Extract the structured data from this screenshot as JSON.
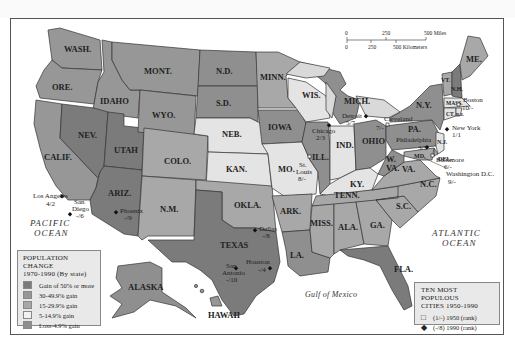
{
  "map": {
    "title": "POPULATION CHANGE",
    "subtitle": "1970-1990 (By state)",
    "colors": {
      "gain_50_plus": "#7b7b7b",
      "gain_30_49": "#979797",
      "gain_15_29": "#a8a8a8",
      "gain_5_14": "#e4e4e4",
      "loss_4_gain": "#8f8f8f",
      "water": "#ffffff",
      "great_lakes": "#d9d9d9"
    },
    "legend_population": {
      "title": "POPULATION CHANGE",
      "subtitle": "1970-1990 (By state)",
      "items": [
        {
          "label": "Gain of 50% or more",
          "color": "#7b7b7b"
        },
        {
          "label": "30-49.9% gain",
          "color": "#979797"
        },
        {
          "label": "15-29.9% gain",
          "color": "#a8a8a8"
        },
        {
          "label": "5-14.9% gain",
          "color": "#f2f2f2"
        },
        {
          "label": "Loss-4.9% gain",
          "color": "#8f8f8f"
        }
      ]
    },
    "legend_cities": {
      "title_line1": "TEN MOST POPULOUS",
      "title_line2": "CITIES 1950-1990",
      "items": [
        {
          "symbol": "□",
          "label": "(1/-) 1950 (rank)"
        },
        {
          "symbol": "◆",
          "label": "(-/8) 1990 (rank)"
        }
      ]
    },
    "scale": {
      "miles_ticks": [
        "0",
        "250",
        "500 Miles"
      ],
      "km_ticks": [
        "0",
        "250",
        "500 Kilometers"
      ]
    },
    "oceans": {
      "pacific_1": "PACIFIC",
      "pacific_2": "OCEAN",
      "atlantic_1": "ATLANTIC",
      "atlantic_2": "OCEAN",
      "gulf": "Gulf of Mexico"
    },
    "states": {
      "wash": "WASH.",
      "ore": "ORE.",
      "calif": "CALIF.",
      "idaho": "IDAHO",
      "nev": "NEV.",
      "mont": "MONT.",
      "wyo": "WYO.",
      "utah": "UTAH",
      "ariz": "ARIZ.",
      "colo": "COLO.",
      "nm": "N.M.",
      "nd": "N.D.",
      "sd": "S.D.",
      "neb": "NEB.",
      "kan": "KAN.",
      "okla": "OKLA.",
      "texas": "TEXAS",
      "minn": "MINN.",
      "iowa": "IOWA",
      "mo": "MO.",
      "ark": "ARK.",
      "la": "LA.",
      "wis": "WIS.",
      "ill": "ILL.",
      "mich": "MICH.",
      "ind": "IND.",
      "ohio": "OHIO",
      "ky": "KY.",
      "tenn": "TENN.",
      "miss": "MISS.",
      "ala": "ALA.",
      "ga": "GA.",
      "fla": "FLA.",
      "sc": "S.C.",
      "nc": "N.C.",
      "va": "VA.",
      "wva_1": "W.",
      "wva_2": "VA.",
      "pa": "PA.",
      "ny": "N.Y.",
      "vt": "VT.",
      "nh": "N.H.",
      "me": "ME.",
      "mass": "MASS.",
      "ri": "R.I.",
      "conn": "CT.",
      "nj": "N.J.",
      "del": "DEL.",
      "md": "MD.",
      "alaska": "ALASKA",
      "hawaii": "HAWAII"
    },
    "cities": [
      {
        "name": "Los Angeles",
        "rank": "4/2"
      },
      {
        "name_1": "San",
        "name_2": "Diego",
        "rank": "-/6"
      },
      {
        "name": "Phoenix",
        "rank": "-/9"
      },
      {
        "name": "Dallas",
        "rank": "-/8"
      },
      {
        "name": "Houston",
        "rank": "-/4"
      },
      {
        "name_1": "San",
        "name_2": "Antonio",
        "rank": "-/10"
      },
      {
        "name": "Chicago",
        "rank": "2/3"
      },
      {
        "name_1": "St.",
        "name_2": "Louis",
        "rank": "8/-"
      },
      {
        "name": "Detroit",
        "rank": "5/7"
      },
      {
        "name": "Cleveland",
        "rank": "7/-"
      },
      {
        "name": "Philadelphia",
        "rank": "3/5"
      },
      {
        "name": "New York",
        "rank": "1/1"
      },
      {
        "name": "Boston",
        "rank": "10/-"
      },
      {
        "name": "Baltimore",
        "rank": "6/-"
      },
      {
        "name": "Washington D.C.",
        "rank": "9/-"
      }
    ]
  }
}
